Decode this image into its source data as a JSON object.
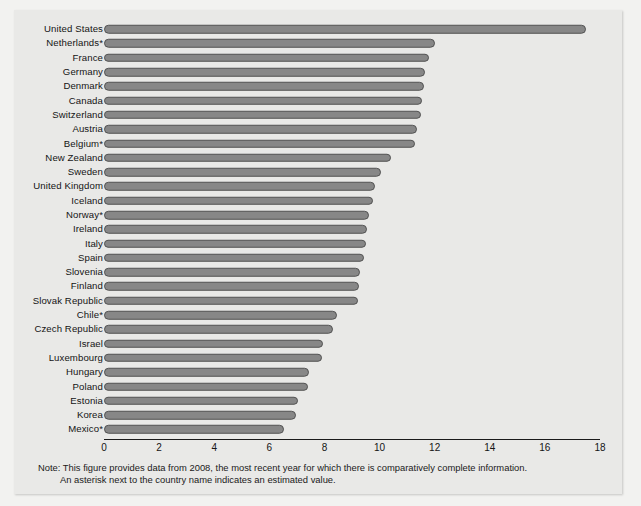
{
  "chart_data": {
    "type": "bar",
    "orientation": "horizontal",
    "title": "",
    "xlabel": "",
    "ylabel": "",
    "xlim": [
      0,
      18
    ],
    "xticks": [
      0,
      2,
      4,
      6,
      8,
      10,
      12,
      14,
      16,
      18
    ],
    "grid": false,
    "legend": null,
    "bar_color": "#878787",
    "bar_edge_color": "#525252",
    "background_color": "#e9e9e7",
    "categories": [
      "United States",
      "Netherlands*",
      "France",
      "Germany",
      "Denmark",
      "Canada",
      "Switzerland",
      "Austria",
      "Belgium*",
      "New Zealand",
      "Sweden",
      "United Kingdom",
      "Iceland",
      "Norway*",
      "Ireland",
      "Italy",
      "Spain",
      "Slovenia",
      "Finland",
      "Slovak Republic",
      "Chile*",
      "Czech Republic",
      "Israel",
      "Luxembourg",
      "Hungary",
      "Poland",
      "Estonia",
      "Korea",
      "Mexico*"
    ],
    "values": [
      17.5,
      12.0,
      11.8,
      11.65,
      11.6,
      11.55,
      11.5,
      11.35,
      11.3,
      10.4,
      10.05,
      9.85,
      9.75,
      9.6,
      9.55,
      9.5,
      9.45,
      9.3,
      9.25,
      9.2,
      8.45,
      8.3,
      7.95,
      7.9,
      7.45,
      7.4,
      7.05,
      6.95,
      6.55
    ]
  },
  "note": {
    "line1": "Note: This figure provides data from 2008, the most recent year for which there is comparatively complete information.",
    "line2": "An asterisk next to the country name indicates an estimated value."
  }
}
